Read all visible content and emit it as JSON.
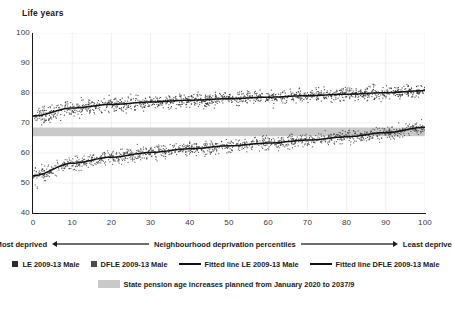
{
  "chart_data": {
    "type": "scatter",
    "title": "",
    "ylabel": "Life years",
    "xlabel": "Neighbourhood deprivation percentiles",
    "xlim": [
      0,
      100
    ],
    "ylim": [
      40,
      100
    ],
    "xticks": [
      0,
      10,
      20,
      30,
      40,
      50,
      60,
      70,
      80,
      90,
      100
    ],
    "yticks": [
      40,
      50,
      60,
      70,
      80,
      90,
      100
    ],
    "grid": "faint vertical and horizontal gridlines",
    "legend_position": "below-axis",
    "axis_direction": {
      "left_label": "Most deprived",
      "right_label": "Least deprived",
      "center_label": "Neighbourhood deprivation percentiles"
    },
    "series": [
      {
        "name": "LE 2009-13 Male",
        "kind": "scatter",
        "color": "#2b2b2b",
        "marker": "square",
        "n_points": 1300,
        "y_at_x": {
          "0": 72.3,
          "10": 75.0,
          "20": 76.2,
          "30": 77.0,
          "40": 77.6,
          "50": 78.1,
          "60": 78.6,
          "70": 79.1,
          "80": 79.6,
          "90": 80.1,
          "100": 80.8
        },
        "spread": 2.6
      },
      {
        "name": "DFLE 2009-13 Male",
        "kind": "scatter",
        "color": "#3a3a3a",
        "marker": "square",
        "n_points": 1300,
        "y_at_x": {
          "0": 52.4,
          "10": 56.6,
          "20": 58.6,
          "30": 60.2,
          "40": 61.4,
          "50": 62.4,
          "60": 63.3,
          "70": 64.3,
          "80": 65.4,
          "90": 66.8,
          "100": 68.6
        },
        "spread": 2.4
      },
      {
        "name": "Fitted line LE 2009-13 Male",
        "kind": "line",
        "color": "#111111",
        "y_at_x": {
          "0": 72.3,
          "10": 75.0,
          "20": 76.2,
          "30": 77.0,
          "40": 77.6,
          "50": 78.1,
          "60": 78.6,
          "70": 79.1,
          "80": 79.6,
          "90": 80.1,
          "100": 80.8
        }
      },
      {
        "name": "Fitted line DFLE 2009-13 Male",
        "kind": "line",
        "color": "#111111",
        "y_at_x": {
          "0": 52.4,
          "10": 56.6,
          "20": 58.6,
          "30": 60.2,
          "40": 61.4,
          "50": 62.4,
          "60": 63.3,
          "70": 64.3,
          "80": 65.4,
          "90": 66.8,
          "100": 68.6
        }
      }
    ],
    "band": {
      "label": "State pension age increases planned from January 2020 to 2037/9",
      "color": "#c9c9c9",
      "y_range": [
        65.6,
        68.5
      ]
    }
  },
  "axis": {
    "ylabel": "Life years",
    "yticks": [
      "100",
      "90",
      "80",
      "70",
      "60",
      "50",
      "40"
    ],
    "xticks": [
      "0",
      "10",
      "20",
      "30",
      "40",
      "50",
      "60",
      "70",
      "80",
      "90",
      "100"
    ]
  },
  "axis_caption": {
    "left": "Most deprived",
    "center": "Neighbourhood deprivation percentiles",
    "right": "Least deprived"
  },
  "legend": {
    "row1": [
      {
        "label": "LE 2009-13 Male",
        "swatch": "square",
        "color": "#2b2b2b"
      },
      {
        "label": "DFLE 2009-13 Male",
        "swatch": "square",
        "color": "#4a4a4a"
      },
      {
        "label": "Fitted line LE 2009-13 Male",
        "swatch": "line",
        "color": "#111111"
      },
      {
        "label": "Fitted line DFLE 2009-13 Male",
        "swatch": "line",
        "color": "#111111"
      }
    ],
    "row2": [
      {
        "label": "State pension age increases planned from January 2020 to 2037/9",
        "swatch": "band",
        "color": "#c9c9c9"
      }
    ]
  }
}
